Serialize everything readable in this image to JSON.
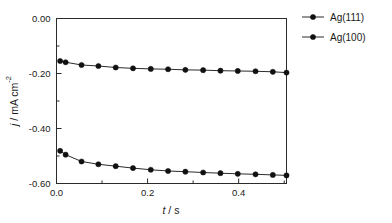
{
  "chart_data": {
    "type": "line",
    "title": "",
    "xlabel": "t / s",
    "ylabel": "j / mA cm-2",
    "xlabel_parts": {
      "symbol": "t",
      "rest": " / s"
    },
    "ylabel_parts": {
      "symbol": "j",
      "rest": " / mA cm",
      "sup": "-2"
    },
    "xlim": [
      0.0,
      0.505
    ],
    "ylim": [
      -0.6,
      0.0
    ],
    "xticks": [
      0.0,
      0.2,
      0.4
    ],
    "xtick_labels": [
      "0.0",
      "0.2",
      "0.4"
    ],
    "xminor_ticks": [
      0.1,
      0.3,
      0.5
    ],
    "yticks": [
      0.0,
      -0.2,
      -0.4,
      -0.6
    ],
    "ytick_labels": [
      "0.00",
      "-0.20",
      "-0.40",
      "-0.60"
    ],
    "yminor_ticks": [
      -0.1,
      -0.3,
      -0.5
    ],
    "grid": false,
    "legend_position": "right-top",
    "marker": "filled-circle",
    "series": [
      {
        "name": "Ag(111)",
        "x": [
          0.008,
          0.02,
          0.055,
          0.092,
          0.13,
          0.168,
          0.207,
          0.245,
          0.283,
          0.322,
          0.36,
          0.398,
          0.437,
          0.475,
          0.505
        ],
        "y": [
          -0.1545,
          -0.159,
          -0.169,
          -0.1728,
          -0.1782,
          -0.1812,
          -0.1832,
          -0.1845,
          -0.1868,
          -0.1878,
          -0.1898,
          -0.1908,
          -0.1918,
          -0.1938,
          -0.1968
        ]
      },
      {
        "name": "Ag(100)",
        "x": [
          0.008,
          0.02,
          0.055,
          0.092,
          0.13,
          0.168,
          0.207,
          0.245,
          0.283,
          0.322,
          0.36,
          0.398,
          0.437,
          0.475,
          0.505
        ],
        "y": [
          -0.4812,
          -0.495,
          -0.52,
          -0.53,
          -0.537,
          -0.544,
          -0.55,
          -0.5545,
          -0.557,
          -0.56,
          -0.5625,
          -0.5648,
          -0.5665,
          -0.5688,
          -0.5705
        ]
      }
    ],
    "legend_entries": [
      {
        "label": "Ag(111)"
      },
      {
        "label": "Ag(100)"
      }
    ],
    "colors": {
      "axis": "#2b2b2b",
      "marker": "#111111",
      "line": "#2b2b2b",
      "background": "#ffffff"
    }
  }
}
